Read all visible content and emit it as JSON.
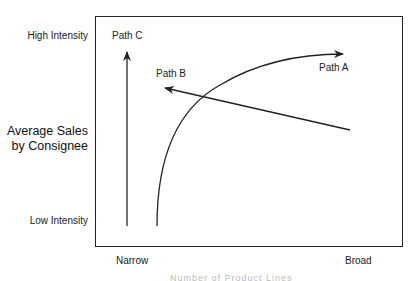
{
  "y_axis": {
    "title_line1": "Average Sales",
    "title_line2": "by Consignee",
    "high_label": "High Intensity",
    "low_label": "Low Intensity"
  },
  "x_axis": {
    "left_label": "Narrow",
    "right_label": "Broad",
    "caption": "Number of Product Lines"
  },
  "paths": [
    {
      "id": "A",
      "label": "Path A",
      "shape": "curve-up-right"
    },
    {
      "id": "B",
      "label": "Path B",
      "shape": "line-toward-upper-left"
    },
    {
      "id": "C",
      "label": "Path C",
      "shape": "vertical-up"
    }
  ],
  "colors": {
    "line": "#222222",
    "text": "#1a1a1a",
    "background": "#ffffff"
  }
}
